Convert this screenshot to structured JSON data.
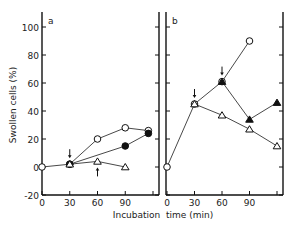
{
  "figure": {
    "ylabel": "Swollen cells (%)",
    "xlabel": "Incubation  time (min)",
    "panel_labels": [
      "a",
      "b"
    ]
  },
  "chart_data": [
    {
      "type": "line",
      "panel": "a",
      "xlabel": "Incubation time (min)",
      "ylabel": "Swollen cells (%)",
      "x_ticks": [
        0,
        30,
        60,
        90
      ],
      "y_ticks": [
        -20,
        0,
        20,
        40,
        60,
        80,
        100
      ],
      "xlim": [
        0,
        125
      ],
      "ylim": [
        -20,
        110
      ],
      "series": [
        {
          "name": "open-circle",
          "marker": "open-circle",
          "x": [
            0,
            30,
            60,
            90,
            115
          ],
          "values": [
            0,
            2,
            20,
            28,
            26
          ]
        },
        {
          "name": "filled-circle",
          "marker": "filled-circle",
          "x": [
            30,
            90,
            115
          ],
          "values": [
            2,
            15,
            24
          ]
        },
        {
          "name": "open-triangle",
          "marker": "open-triangle",
          "x": [
            30,
            60,
            90
          ],
          "values": [
            2,
            4,
            0
          ]
        }
      ],
      "annotations": [
        {
          "type": "arrow-down",
          "x": 30,
          "y": 2
        },
        {
          "type": "arrow-up",
          "x": 60,
          "y": 4
        }
      ]
    },
    {
      "type": "line",
      "panel": "b",
      "xlabel": "Incubation time (min)",
      "ylabel": "Swollen cells (%)",
      "x_ticks": [
        0,
        30,
        60,
        90
      ],
      "y_ticks": [
        -20,
        0,
        20,
        40,
        60,
        80,
        100
      ],
      "xlim": [
        0,
        125
      ],
      "ylim": [
        -20,
        110
      ],
      "series": [
        {
          "name": "open-circle",
          "marker": "open-circle",
          "x": [
            0,
            30,
            60,
            90
          ],
          "values": [
            0,
            45,
            61,
            90
          ]
        },
        {
          "name": "open-triangle",
          "marker": "open-triangle",
          "x": [
            30,
            60,
            90,
            120
          ],
          "values": [
            45,
            37,
            27,
            15
          ]
        },
        {
          "name": "filled-triangle",
          "marker": "filled-triangle",
          "x": [
            60,
            90,
            120
          ],
          "values": [
            61,
            34,
            46
          ]
        }
      ],
      "annotations": [
        {
          "type": "arrow-down",
          "x": 30,
          "y": 45
        },
        {
          "type": "arrow-down",
          "x": 60,
          "y": 61
        }
      ]
    }
  ]
}
